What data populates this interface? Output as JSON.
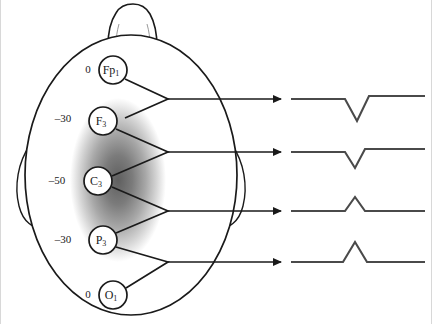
{
  "figure": {
    "background_color": "#ffffff",
    "width": 432,
    "height": 324
  },
  "head": {
    "outline_color": "#1a1a1a",
    "fill_color": "#ffffff",
    "cx": 131,
    "cy": 175,
    "rx": 106,
    "ry": 140,
    "nose": {
      "name": "nose",
      "apex_y": 6
    },
    "ears": {
      "left_name": "left-ear",
      "right_name": "right-ear"
    }
  },
  "field_blob": {
    "name": "potential-field-blob",
    "center_color": "#6e6e6e",
    "edge_color": "#ffffff",
    "cx": 118,
    "cy": 180,
    "rx": 48,
    "ry": 82
  },
  "electrodes": [
    {
      "name": "electrode-fp1",
      "label": "Fp",
      "subscript": "1",
      "voltage": "0",
      "cx": 113,
      "cy": 70,
      "r": 14,
      "voltage_x": 88,
      "voltage_y": 70
    },
    {
      "name": "electrode-f3",
      "label": "F",
      "subscript": "3",
      "voltage": "–30",
      "cx": 103,
      "cy": 121,
      "r": 14,
      "voltage_x": 63,
      "voltage_y": 119
    },
    {
      "name": "electrode-c3",
      "label": "C",
      "subscript": "3",
      "voltage": "–50",
      "cx": 98,
      "cy": 181,
      "r": 14,
      "voltage_x": 57,
      "voltage_y": 181
    },
    {
      "name": "electrode-p3",
      "label": "P",
      "subscript": "3",
      "voltage": "–30",
      "cx": 103,
      "cy": 240,
      "r": 14,
      "voltage_x": 63,
      "voltage_y": 240
    },
    {
      "name": "electrode-o1",
      "label": "O",
      "subscript": "1",
      "voltage": "0",
      "cx": 113,
      "cy": 295,
      "r": 14,
      "voltage_x": 88,
      "voltage_y": 295
    }
  ],
  "derivations": [
    {
      "name": "derivation-fp1-f3",
      "from": "Fp1",
      "to": "F3",
      "vertex_x": 168,
      "vertex_y": 99,
      "arrow_end_x": 283
    },
    {
      "name": "derivation-f3-c3",
      "from": "F3",
      "to": "C3",
      "vertex_x": 168,
      "vertex_y": 152,
      "arrow_end_x": 283
    },
    {
      "name": "derivation-c3-p3",
      "from": "C3",
      "to": "P3",
      "vertex_x": 168,
      "vertex_y": 211,
      "arrow_end_x": 283
    },
    {
      "name": "derivation-p3-o1",
      "from": "P3",
      "to": "O1",
      "vertex_x": 168,
      "vertex_y": 262,
      "arrow_end_x": 283
    }
  ],
  "waveforms": [
    {
      "name": "waveform-fp1-f3",
      "baseline_y": 99,
      "direction": "down",
      "amplitude": 22,
      "deflection_start_x": 345,
      "deflection_peak_x": 357,
      "deflection_end_x": 369,
      "start_x": 291,
      "end_x": 425,
      "post_offset": -3
    },
    {
      "name": "waveform-f3-c3",
      "baseline_y": 152,
      "direction": "down",
      "amplitude": 16,
      "deflection_start_x": 345,
      "deflection_peak_x": 355,
      "deflection_end_x": 365,
      "start_x": 291,
      "end_x": 425,
      "post_offset": -3
    },
    {
      "name": "waveform-c3-p3",
      "baseline_y": 211,
      "direction": "up",
      "amplitude": 14,
      "deflection_start_x": 345,
      "deflection_peak_x": 355,
      "deflection_end_x": 365,
      "start_x": 291,
      "end_x": 425,
      "post_offset": 0
    },
    {
      "name": "waveform-p3-o1",
      "baseline_y": 262,
      "direction": "up",
      "amplitude": 20,
      "deflection_start_x": 343,
      "deflection_peak_x": 355,
      "deflection_end_x": 367,
      "start_x": 291,
      "end_x": 425,
      "post_offset": 0
    }
  ],
  "style": {
    "trace_color": "#4a4a4a",
    "arrow_color": "#1a1a1a",
    "electrode_ring_color": "#1a1a1a",
    "electrode_fill": "#ffffff"
  }
}
